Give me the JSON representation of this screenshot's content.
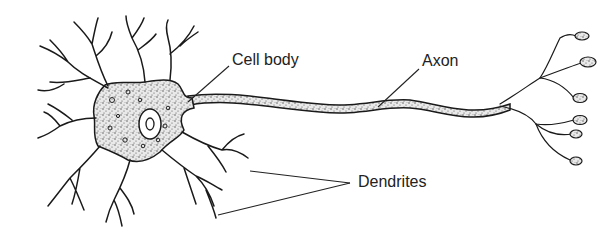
{
  "diagram": {
    "colors": {
      "ink": "#1a1a1a",
      "background": "#ffffff",
      "label_text": "#222222"
    },
    "labels": [
      {
        "id": "cell_body",
        "text": "Cell body",
        "x": 232,
        "y": 52
      },
      {
        "id": "axon",
        "text": "Axon",
        "x": 422,
        "y": 53
      },
      {
        "id": "dendrites",
        "text": "Dendrites",
        "x": 358,
        "y": 174
      }
    ],
    "parts": [
      "dendrites",
      "cell body",
      "nucleus",
      "axon",
      "axon terminals"
    ],
    "axon_terminal_count": 6
  }
}
